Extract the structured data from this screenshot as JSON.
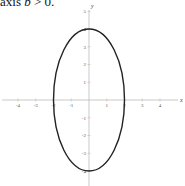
{
  "caption": {
    "prefix": "axis ",
    "variable": "b",
    "suffix": " > 0."
  },
  "chart_data": {
    "type": "line",
    "title": "",
    "xlabel": "x",
    "ylabel": "y",
    "xlim": [
      -5,
      5
    ],
    "ylim": [
      -5,
      5
    ],
    "x_ticks": [
      -4,
      -3,
      -2,
      -1,
      1,
      2,
      3,
      4
    ],
    "y_ticks": [
      5,
      4,
      3,
      2,
      1,
      -1,
      -2,
      -3,
      -4,
      -5
    ],
    "grid": false,
    "series": [
      {
        "name": "ellipse",
        "shape": "ellipse",
        "center": [
          0,
          0
        ],
        "semi_axis_x": 2,
        "semi_axis_y": 4,
        "color": "#222222",
        "points": [
          [
            2,
            0
          ],
          [
            0,
            4
          ],
          [
            -2,
            0
          ],
          [
            0,
            -4
          ]
        ]
      }
    ],
    "axis_color": "#bbbbbb"
  }
}
